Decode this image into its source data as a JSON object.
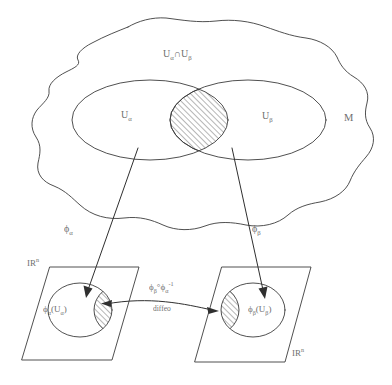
{
  "figure": {
    "kind": "mathematical-diagram",
    "background_color": "#ffffff",
    "ink_color": "#3c3c3c",
    "width": 392,
    "height": 385
  },
  "manifold": {
    "name_label": "M",
    "intersection_label_plain": "U",
    "intersection_label": "Uα∩Uβ",
    "intersection_symbol": "∩",
    "chart_domain_left": "U",
    "chart_domain_left_sub": "α",
    "chart_domain_right": "U",
    "chart_domain_right_sub": "β",
    "top_sub_alpha": "α",
    "top_sub_beta": "β"
  },
  "maps": {
    "phi_alpha_symbol": "ϕ",
    "phi_alpha_sub": "α",
    "phi_beta_symbol": "ϕ",
    "phi_beta_sub": "β",
    "transition_symbol": "ϕ",
    "transition_full": "ϕβ°ϕα⁻¹",
    "transition_compose_op": "°",
    "transition_inverse_sup": "-1",
    "transition_caption": "diffeo"
  },
  "planes": {
    "left": {
      "space_label": "IR",
      "space_superscript": "n",
      "image_label_phi": "ϕ",
      "image_label_sub": "α",
      "image_label_open": "(U",
      "image_label_close": ")",
      "image_label_full": "ϕα(Uα)"
    },
    "right": {
      "space_label": "IR",
      "space_superscript": "n",
      "image_label_phi": "ϕ",
      "image_label_sub": "β",
      "image_label_open": "(U",
      "image_label_close": ")",
      "image_label_full": "ϕβ(Uβ)"
    }
  },
  "hatching": {
    "description": "diagonal line fill marking the overlap region and its chart images",
    "angle_degrees": 45,
    "spacing_px": 4,
    "stroke_color": "#3c3c3c"
  }
}
